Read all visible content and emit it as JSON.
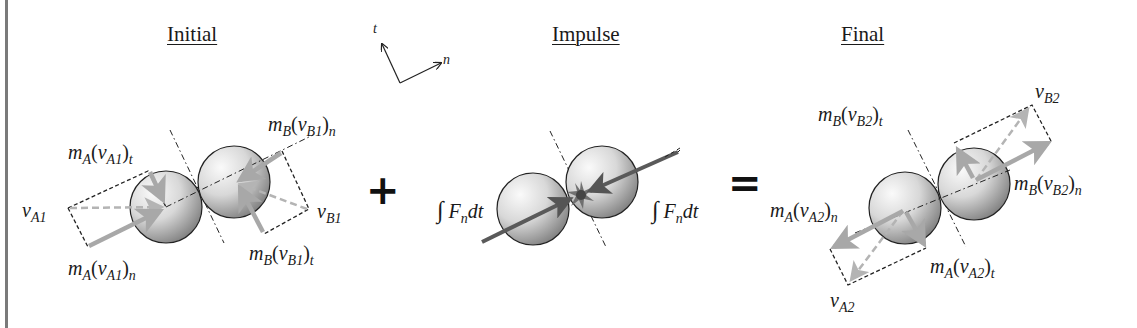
{
  "diagram": {
    "type": "impulse-momentum diagram, oblique central impact of two spheres",
    "panels": [
      {
        "id": "initial",
        "heading": "Initial"
      },
      {
        "id": "impulse",
        "heading": "Impulse"
      },
      {
        "id": "final",
        "heading": "Final"
      }
    ],
    "operators": {
      "plus": "+",
      "equals": "="
    },
    "axes": {
      "t_label": "t",
      "n_label": "n"
    },
    "initial": {
      "mA_vA1_t": {
        "base": "m",
        "base_sub": "A",
        "paren_open": "(",
        "v": "v",
        "v_sub": "A1",
        "paren_close": ")",
        "comp": "t"
      },
      "vA1": {
        "v": "v",
        "v_sub": "A1"
      },
      "mA_vA1_n": {
        "base": "m",
        "base_sub": "A",
        "paren_open": "(",
        "v": "v",
        "v_sub": "A1",
        "paren_close": ")",
        "comp": "n"
      },
      "mB_vB1_n": {
        "base": "m",
        "base_sub": "B",
        "paren_open": "(",
        "v": "v",
        "v_sub": "B1",
        "paren_close": ")",
        "comp": "n"
      },
      "vB1": {
        "v": "v",
        "v_sub": "B1"
      },
      "mB_vB1_t": {
        "base": "m",
        "base_sub": "B",
        "paren_open": "(",
        "v": "v",
        "v_sub": "B1",
        "paren_close": ")",
        "comp": "t"
      }
    },
    "impulse": {
      "left": {
        "integral": "∫",
        "F": "F",
        "F_sub": "n",
        "dt": "dt"
      },
      "right": {
        "integral": "∫",
        "F": "F",
        "F_sub": "n",
        "dt": "dt"
      }
    },
    "final": {
      "mB_vB2_t": {
        "base": "m",
        "base_sub": "B",
        "paren_open": "(",
        "v": "v",
        "v_sub": "B2",
        "paren_close": ")",
        "comp": "t"
      },
      "vB2": {
        "v": "v",
        "v_sub": "B2"
      },
      "mB_vB2_n": {
        "base": "m",
        "base_sub": "B",
        "paren_open": "(",
        "v": "v",
        "v_sub": "B2",
        "paren_close": ")",
        "comp": "n"
      },
      "mA_vA2_n": {
        "base": "m",
        "base_sub": "A",
        "paren_open": "(",
        "v": "v",
        "v_sub": "A2",
        "paren_close": ")",
        "comp": "n"
      },
      "mA_vA2_t": {
        "base": "m",
        "base_sub": "A",
        "paren_open": "(",
        "v": "v",
        "v_sub": "A2",
        "paren_close": ")",
        "comp": "t"
      },
      "vA2": {
        "v": "v",
        "v_sub": "A2"
      }
    },
    "colors": {
      "ink": "#1a1a1a",
      "momentum_arrow": "#a8a8a8",
      "velocity_dashed": "#b4b4b4",
      "impulse_arrow": "#5a5a5a",
      "left_rule": "#7a7a7a",
      "ball_light": "#f4f4f4",
      "ball_dark": "#6e6e6e"
    }
  }
}
